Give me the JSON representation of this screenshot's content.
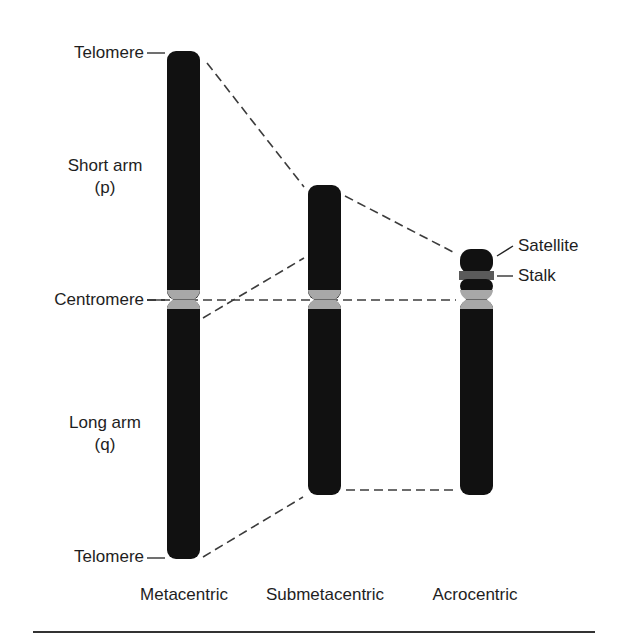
{
  "diagram": {
    "type": "chromosome-types",
    "colors": {
      "chromatin": "#111111",
      "centromere": "#a8a8a8",
      "stalk": "#5a5a5a",
      "connector": "#3c3c3c",
      "background": "#ffffff"
    },
    "left_labels": {
      "telomere_top": "Telomere",
      "short_arm_line1": "Short arm",
      "short_arm_line2": "(p)",
      "centromere": "Centromere",
      "long_arm_line1": "Long arm",
      "long_arm_line2": "(q)",
      "telomere_bottom": "Telomere"
    },
    "right_labels": {
      "satellite": "Satellite",
      "stalk": "Stalk"
    },
    "chromosomes": [
      {
        "name": "Metacentric"
      },
      {
        "name": "Submetacentric"
      },
      {
        "name": "Acrocentric"
      }
    ]
  }
}
